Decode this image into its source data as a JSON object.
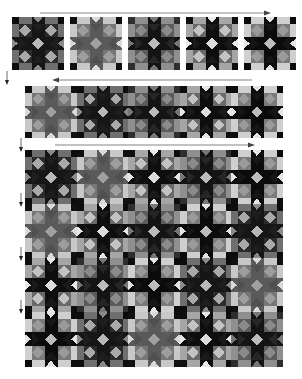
{
  "diagram": {
    "colors": {
      "background": "#ffffff",
      "dark": "#141414",
      "darker": "#0a0a0a",
      "medium_dark": "#3a3a3a",
      "medium": "#6e6e6e",
      "medium_light": "#8e8e8e",
      "light": "#bdbdbd",
      "lightest": "#e2e2e2",
      "arrow": "#555555"
    },
    "step1": {
      "label": "Individual blocks",
      "arrow_direction": "right",
      "blocks": [
        {
          "id": 1,
          "star": "#161616",
          "bg": "#1e1e1e",
          "corner": "#2b2b2b",
          "rect": "#6f6f6f",
          "diamond": "#a9a9a9",
          "center": "#b8b8b8",
          "corner_sq": "#0c0c0c",
          "accent": "#8a8a8a"
        },
        {
          "id": 2,
          "star": "#5a5a5a",
          "bg": "#505050",
          "corner": "#777777",
          "rect": "#c8c8c8",
          "diamond": "#9d9d9d",
          "center": "#a0a0a0",
          "corner_sq": "#101010",
          "accent": "#dadada"
        },
        {
          "id": 3,
          "star": "#141414",
          "bg": "#262626",
          "corner": "#5c5c5c",
          "rect": "#8f8f8f",
          "diamond": "#8a8a8a",
          "center": "#bcbcbc",
          "corner_sq": "#2e2e2e",
          "accent": "#777777"
        },
        {
          "id": 4,
          "star": "#0e0e0e",
          "bg": "#1a1a1a",
          "corner": "#6a6a6a",
          "rect": "#a6a6a6",
          "diamond": "#c3c3c3",
          "center": "#dcdcdc",
          "corner_sq": "#0e0e0e",
          "accent": "#e8e8e8"
        },
        {
          "id": 5,
          "star": "#0b0b0b",
          "bg": "#161616",
          "corner": "#7a7a7a",
          "rect": "#cfcfcf",
          "diamond": "#9a9a9a",
          "center": "#bdbdbd",
          "corner_sq": "#0c0c0c",
          "accent": "#e5e5e5"
        }
      ]
    },
    "step2": {
      "label": "Blocks joined into a row",
      "arrow_direction": "left",
      "columns": 5
    },
    "step3": {
      "label": "Rows joined into quilt top",
      "arrow_direction": "right",
      "columns": 5,
      "rows": 4
    },
    "arrows": {
      "horizontal": [
        {
          "id": "step1-arrow",
          "direction": "right"
        },
        {
          "id": "step2-arrow",
          "direction": "left"
        },
        {
          "id": "step3-arrow",
          "direction": "right"
        }
      ],
      "vertical_count": 5
    }
  }
}
